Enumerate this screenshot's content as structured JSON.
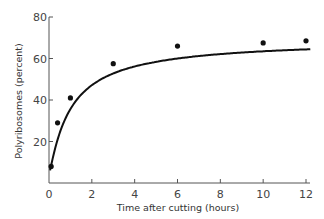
{
  "chart_data": {
    "type": "line",
    "title": "",
    "xlabel": "Time after cutting (hours)",
    "ylabel": "Polyribosomes (percent)",
    "xlim": [
      0,
      12
    ],
    "ylim": [
      0,
      80
    ],
    "xticks": [
      0,
      2,
      4,
      6,
      8,
      10,
      12
    ],
    "xtick_labels": [
      "0",
      "2",
      "4",
      "6",
      "8",
      "10",
      "12"
    ],
    "yticks": [
      20,
      40,
      60,
      80
    ],
    "ytick_labels": [
      "20",
      "40",
      "60",
      "80"
    ],
    "grid": false,
    "legend": null,
    "series": [
      {
        "name": "Polyribosomes",
        "style": "points with smooth fitted curve",
        "x": [
          0.1,
          0.4,
          1.0,
          3.0,
          6.0,
          10.0,
          12.0
        ],
        "y": [
          8,
          29,
          41,
          57.5,
          66,
          67.5,
          68.5
        ]
      }
    ]
  },
  "colors": {
    "line": "#111111",
    "axis": "#555555",
    "text": "#444444"
  }
}
